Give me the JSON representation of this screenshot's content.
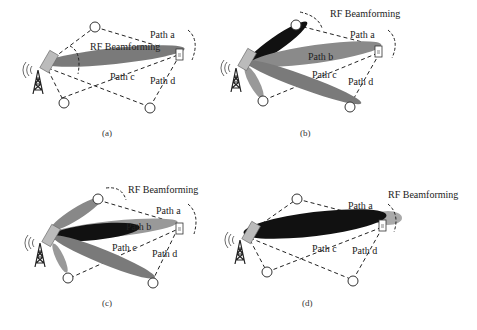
{
  "figure": {
    "panels": [
      {
        "id": "a",
        "caption": "(a)",
        "beam_label": "RF Beamforming",
        "paths": [
          "Path a",
          "Path c",
          "Path d"
        ]
      },
      {
        "id": "b",
        "caption": "(b)",
        "beam_label": "RF Beamforming",
        "paths": [
          "Path a",
          "Path b",
          "Path c",
          "Path d"
        ]
      },
      {
        "id": "c",
        "caption": "(c)",
        "beam_label": "RF Beamforming",
        "paths": [
          "Path a",
          "Path b",
          "Path c",
          "Path d"
        ]
      },
      {
        "id": "d",
        "caption": "(d)",
        "beam_label": "RF Beamforming",
        "paths": [
          "Path a",
          "Path c",
          "Path d"
        ]
      }
    ]
  },
  "colors": {
    "beam_gray": "#7a7a7a",
    "beam_dark": "#111111",
    "beam_light": "#b0b0b0",
    "line": "#222222"
  }
}
